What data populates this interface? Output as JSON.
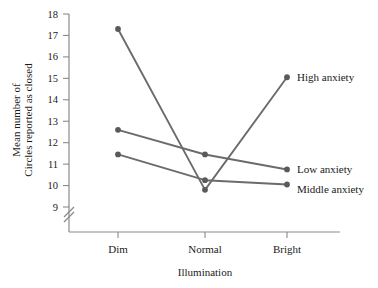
{
  "chart_data": {
    "type": "line",
    "title": "",
    "xlabel": "Illumination",
    "ylabel_line1": "Mean number of",
    "ylabel_line2": "Circles reported as closed",
    "categories": [
      "Dim",
      "Normal",
      "Bright"
    ],
    "ylim": [
      9,
      18
    ],
    "yticks": [
      9,
      10,
      11,
      12,
      13,
      14,
      15,
      16,
      17,
      18
    ],
    "ytick_labels": [
      "9",
      "10",
      "11",
      "12",
      "13",
      "14",
      "15",
      "16",
      "17",
      "18"
    ],
    "axis_break": true,
    "grid": false,
    "legend_position": "right-inline",
    "series": [
      {
        "name": "High anxiety",
        "values": [
          17.3,
          9.8,
          15.05
        ]
      },
      {
        "name": "Low anxiety",
        "values": [
          12.6,
          11.45,
          10.75
        ]
      },
      {
        "name": "Middle anxiety",
        "values": [
          11.45,
          10.25,
          10.05
        ]
      }
    ],
    "colors": {
      "line": "#6b6b6b",
      "marker": "#5a5a5a",
      "axis": "#8a8a8a",
      "text": "#1a1a1a"
    }
  }
}
